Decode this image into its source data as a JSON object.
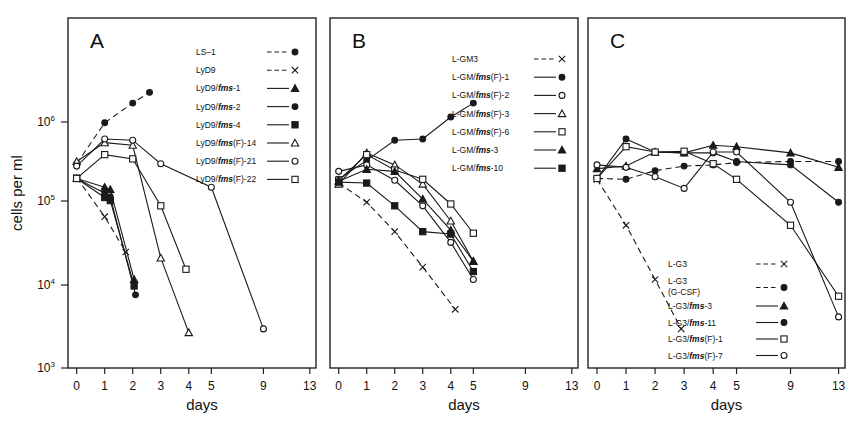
{
  "figure": {
    "y_axis_label": "cells per ml",
    "x_axis_label": "days",
    "y_ticks": [
      {
        "label": "10",
        "exp": "3",
        "value": 1000
      },
      {
        "label": "10",
        "exp": "4",
        "value": 10000
      },
      {
        "label": "10",
        "exp": "5",
        "value": 100000
      },
      {
        "label": "10",
        "exp": "6",
        "value": 1000000
      }
    ],
    "x_ticks": [
      "0",
      "1",
      "2",
      "3",
      "4",
      "5",
      "9",
      "13"
    ]
  },
  "chart_data": [
    {
      "type": "line",
      "panel": "A",
      "title": "A",
      "xlabel": "days",
      "ylabel": "cells per ml",
      "ylim": [
        1000,
        2000000
      ],
      "xticks": [
        0,
        1,
        2,
        3,
        4,
        5,
        9,
        13
      ],
      "grid": false,
      "legend_position": "top-right",
      "series": [
        {
          "name": "LS-1",
          "marker": "filled-circle",
          "line": "dashed",
          "x": [
            0,
            1,
            2,
            2.6
          ],
          "y": [
            310000,
            980000,
            1700000,
            2300000
          ]
        },
        {
          "name": "LyD9",
          "marker": "x",
          "line": "dashed",
          "x": [
            0,
            1,
            1.75
          ],
          "y": [
            210000,
            70000,
            26000
          ]
        },
        {
          "name": "LyD9/fms-1",
          "marker": "filled-triangle",
          "line": "solid",
          "x": [
            0,
            1,
            1.2,
            2.05
          ],
          "y": [
            205000,
            160000,
            150000,
            12000
          ]
        },
        {
          "name": "LyD9/fms-2",
          "marker": "filled-circle",
          "line": "solid",
          "x": [
            0,
            1,
            1.2,
            2.1
          ],
          "y": [
            205000,
            135000,
            122000,
            7800
          ]
        },
        {
          "name": "LyD9/fms-4",
          "marker": "filled-square",
          "line": "solid",
          "x": [
            0,
            1,
            1.2,
            2.05
          ],
          "y": [
            205000,
            120000,
            110000,
            10000
          ]
        },
        {
          "name": "LyD9/fms(F)-14",
          "marker": "open-triangle",
          "line": "solid",
          "x": [
            0,
            1,
            2,
            3,
            4
          ],
          "y": [
            330000,
            560000,
            520000,
            22000,
            2700
          ]
        },
        {
          "name": "LyD9/fms(F)-21",
          "marker": "open-circle",
          "line": "solid",
          "x": [
            0,
            1,
            2,
            3,
            5,
            9
          ],
          "y": [
            290000,
            620000,
            600000,
            310000,
            160000,
            3000
          ]
        },
        {
          "name": "LyD9/fms(F)-22",
          "marker": "open-square",
          "line": "solid",
          "x": [
            0,
            1,
            2,
            3,
            3.9
          ],
          "y": [
            205000,
            400000,
            355000,
            95000,
            16000
          ]
        }
      ]
    },
    {
      "type": "line",
      "panel": "B",
      "title": "B",
      "xlabel": "days",
      "ylabel": "cells per ml",
      "ylim": [
        1000,
        2000000
      ],
      "xticks": [
        0,
        1,
        2,
        3,
        4,
        5,
        9,
        13
      ],
      "grid": false,
      "legend_position": "top-right",
      "series": [
        {
          "name": "L-GM3",
          "marker": "x",
          "line": "dashed",
          "x": [
            0,
            1,
            2,
            3,
            4.2
          ],
          "y": [
            180000,
            105000,
            46000,
            17000,
            5200
          ]
        },
        {
          "name": "L-GM/fms(F)-1",
          "marker": "filled-circle",
          "line": "solid",
          "x": [
            0,
            1,
            2,
            3,
            4,
            5
          ],
          "y": [
            200000,
            340000,
            600000,
            620000,
            1150000,
            1700000
          ]
        },
        {
          "name": "L-GM/fms(F)-2",
          "marker": "open-circle",
          "line": "solid",
          "x": [
            0,
            1,
            2,
            3,
            4,
            5
          ],
          "y": [
            250000,
            300000,
            195000,
            95000,
            34000,
            12000
          ]
        },
        {
          "name": "L-GM/fms(F)-3",
          "marker": "open-triangle",
          "line": "solid",
          "x": [
            0,
            1,
            2,
            3,
            4,
            5
          ],
          "y": [
            175000,
            420000,
            300000,
            175000,
            62000,
            20000
          ]
        },
        {
          "name": "L-GM/fms(F)-6",
          "marker": "open-square",
          "line": "solid",
          "x": [
            0,
            1,
            2,
            3,
            4,
            5
          ],
          "y": [
            195000,
            400000,
            260000,
            200000,
            100000,
            44000
          ]
        },
        {
          "name": "L-GM/fms-3",
          "marker": "filled-triangle",
          "line": "solid",
          "x": [
            0,
            1,
            2,
            3,
            4,
            5
          ],
          "y": [
            190000,
            265000,
            250000,
            115000,
            48000,
            20000
          ]
        },
        {
          "name": "L-GM/fms-10",
          "marker": "filled-square",
          "line": "solid",
          "x": [
            0,
            1,
            2,
            3,
            4,
            5
          ],
          "y": [
            185000,
            180000,
            95000,
            46000,
            43000,
            15000
          ]
        }
      ]
    },
    {
      "type": "line",
      "panel": "C",
      "title": "C",
      "xlabel": "days",
      "ylabel": "cells per ml",
      "ylim": [
        1000,
        2000000
      ],
      "xticks": [
        0,
        1,
        2,
        3,
        4,
        5,
        9,
        13
      ],
      "grid": false,
      "legend_position": "bottom-center",
      "series": [
        {
          "name": "L-G3",
          "marker": "x",
          "line": "dashed",
          "x": [
            0,
            1,
            2,
            2.9
          ],
          "y": [
            200000,
            55000,
            12000,
            3000
          ]
        },
        {
          "name": "L-G3 (G-CSF)",
          "marker": "filled-circle",
          "line": "dashed",
          "x": [
            0,
            1,
            2,
            3,
            4,
            5,
            9,
            13
          ],
          "y": [
            205000,
            200000,
            255000,
            290000,
            300000,
            320000,
            330000,
            330000
          ]
        },
        {
          "name": "L-G3/fms-3",
          "marker": "filled-triangle",
          "line": "solid",
          "x": [
            0,
            1,
            2,
            3,
            4,
            5,
            9,
            13
          ],
          "y": [
            270000,
            290000,
            430000,
            420000,
            520000,
            500000,
            420000,
            280000
          ]
        },
        {
          "name": "L-G3/fms-11",
          "marker": "filled-circle",
          "line": "solid",
          "x": [
            0,
            1,
            2,
            3,
            4,
            5,
            9,
            13
          ],
          "y": [
            205000,
            620000,
            430000,
            420000,
            420000,
            330000,
            300000,
            105000
          ]
        },
        {
          "name": "L-G3/fms(F)-1",
          "marker": "open-square",
          "line": "solid",
          "x": [
            0,
            1,
            2,
            3,
            4,
            5,
            9,
            13
          ],
          "y": [
            205000,
            500000,
            430000,
            440000,
            310000,
            200000,
            55000,
            7500
          ]
        },
        {
          "name": "L-G3/fms(F)-7",
          "marker": "open-circle",
          "line": "solid",
          "x": [
            0,
            1,
            2,
            3,
            4,
            5,
            9,
            13
          ],
          "y": [
            300000,
            280000,
            215000,
            155000,
            430000,
            430000,
            105000,
            4200
          ]
        }
      ]
    }
  ],
  "panels": [
    {
      "letter": "A",
      "legend": [
        {
          "label": "LS–1",
          "italic_part": "",
          "marker": "filled-circle",
          "line": "dashed"
        },
        {
          "label": "LyD9",
          "italic_part": "",
          "marker": "x",
          "line": "dashed"
        },
        {
          "label": "LyD9/fms-1",
          "pre": "LyD9/",
          "it": "fms",
          "post": "-1",
          "marker": "filled-triangle",
          "line": "solid"
        },
        {
          "label": "LyD9/fms-2",
          "pre": "LyD9/",
          "it": "fms",
          "post": "-2",
          "marker": "filled-circle",
          "line": "solid"
        },
        {
          "label": "LyD9/fms-4",
          "pre": "LyD9/",
          "it": "fms",
          "post": "-4",
          "marker": "filled-square",
          "line": "solid"
        },
        {
          "label": "LyD9/fms(F)-14",
          "pre": "LyD9/",
          "it": "fms",
          "post": "(F)-14",
          "marker": "open-triangle",
          "line": "solid"
        },
        {
          "label": "LyD9/fms(F)-21",
          "pre": "LyD9/",
          "it": "fms",
          "post": "(F)-21",
          "marker": "open-circle",
          "line": "solid"
        },
        {
          "label": "LyD9/fms(F)-22",
          "pre": "LyD9/",
          "it": "fms",
          "post": "(F)-22",
          "marker": "open-square",
          "line": "solid"
        }
      ]
    },
    {
      "letter": "B",
      "legend": [
        {
          "label": "L-GM3",
          "pre": "L-GM3",
          "it": "",
          "post": "",
          "marker": "x",
          "line": "dashed"
        },
        {
          "label": "L-GM/fms(F)-1",
          "pre": "L-GM/",
          "it": "fms",
          "post": "(F)-1",
          "marker": "filled-circle",
          "line": "solid"
        },
        {
          "label": "L-GM/fms(F)-2",
          "pre": "L-GM/",
          "it": "fms",
          "post": "(F)-2",
          "marker": "open-circle",
          "line": "solid"
        },
        {
          "label": "L-GM/fms(F)-3",
          "pre": "L-GM/",
          "it": "fms",
          "post": "(F)-3",
          "marker": "open-triangle",
          "line": "solid"
        },
        {
          "label": "L-GM/fms(F)-6",
          "pre": "L-GM/",
          "it": "fms",
          "post": "(F)-6",
          "marker": "open-square",
          "line": "solid"
        },
        {
          "label": "L-GM/fms-3",
          "pre": "L-GM/",
          "it": "fms",
          "post": "-3",
          "marker": "filled-triangle",
          "line": "solid"
        },
        {
          "label": "L-GM/fms-10",
          "pre": "L-GM/",
          "it": "fms",
          "post": "-10",
          "marker": "filled-square",
          "line": "solid"
        }
      ]
    },
    {
      "letter": "C",
      "legend": [
        {
          "label": "L-G3",
          "pre": "L-G3",
          "it": "",
          "post": "",
          "marker": "x",
          "line": "dashed"
        },
        {
          "label": "L-G3 (G-CSF)",
          "pre": "L-G3",
          "it": "",
          "post": "",
          "line2": "(G-CSF)",
          "marker": "filled-circle",
          "line": "dashed"
        },
        {
          "label": "L-G3/fms-3",
          "pre": "L-G3/",
          "it": "fms",
          "post": "-3",
          "marker": "filled-triangle",
          "line": "solid"
        },
        {
          "label": "L-G3/fms-11",
          "pre": "L-G3/",
          "it": "fms",
          "post": "-11",
          "marker": "filled-circle",
          "line": "solid"
        },
        {
          "label": "L-G3/fms(F)-1",
          "pre": "L-G3/",
          "it": "fms",
          "post": "(F)-1",
          "marker": "open-square",
          "line": "solid"
        },
        {
          "label": "L-G3/fms(F)-7",
          "pre": "L-G3/",
          "it": "fms",
          "post": "(F)-7",
          "marker": "open-circle",
          "line": "solid"
        }
      ]
    }
  ]
}
